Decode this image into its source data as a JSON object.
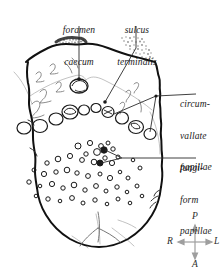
{
  "figure": {
    "background_color": "#ffffff",
    "ink_color": "#111111",
    "faint_ink_color": "#9a9a9a",
    "arrow_color": "#9e9e9e"
  },
  "labels": {
    "foramen_caecum": {
      "line1": "foramen",
      "line2": "caecum",
      "full": "foramen caecum"
    },
    "sulcus_terminalis": {
      "line1": "sulcus",
      "line2": "terminalis",
      "full": "sulcus terminalis"
    },
    "circumvallate_papillae": {
      "line1": "circum-",
      "line2": "vallate",
      "line3": "papillae",
      "full": "circumvallate papillae"
    },
    "fungiform_papillae": {
      "line1": "fungi-",
      "line2": "form",
      "line3": "papillae",
      "full": "fungiform papillae"
    }
  },
  "orientation_compass": {
    "name": "anatomical-orientation-indicator",
    "posterior": "P",
    "anterior": "A",
    "left": "L",
    "right": "R"
  },
  "anatomy": {
    "structures": [
      "tongue-outline",
      "foramen-caecum",
      "sulcus-terminalis",
      "circumvallate-papillae",
      "fungiform-papillae",
      "lingual-tonsil-stipple",
      "median-sulcus"
    ],
    "circumvallate_papillae_count": 11,
    "fungiform_papillae_count": 48
  }
}
